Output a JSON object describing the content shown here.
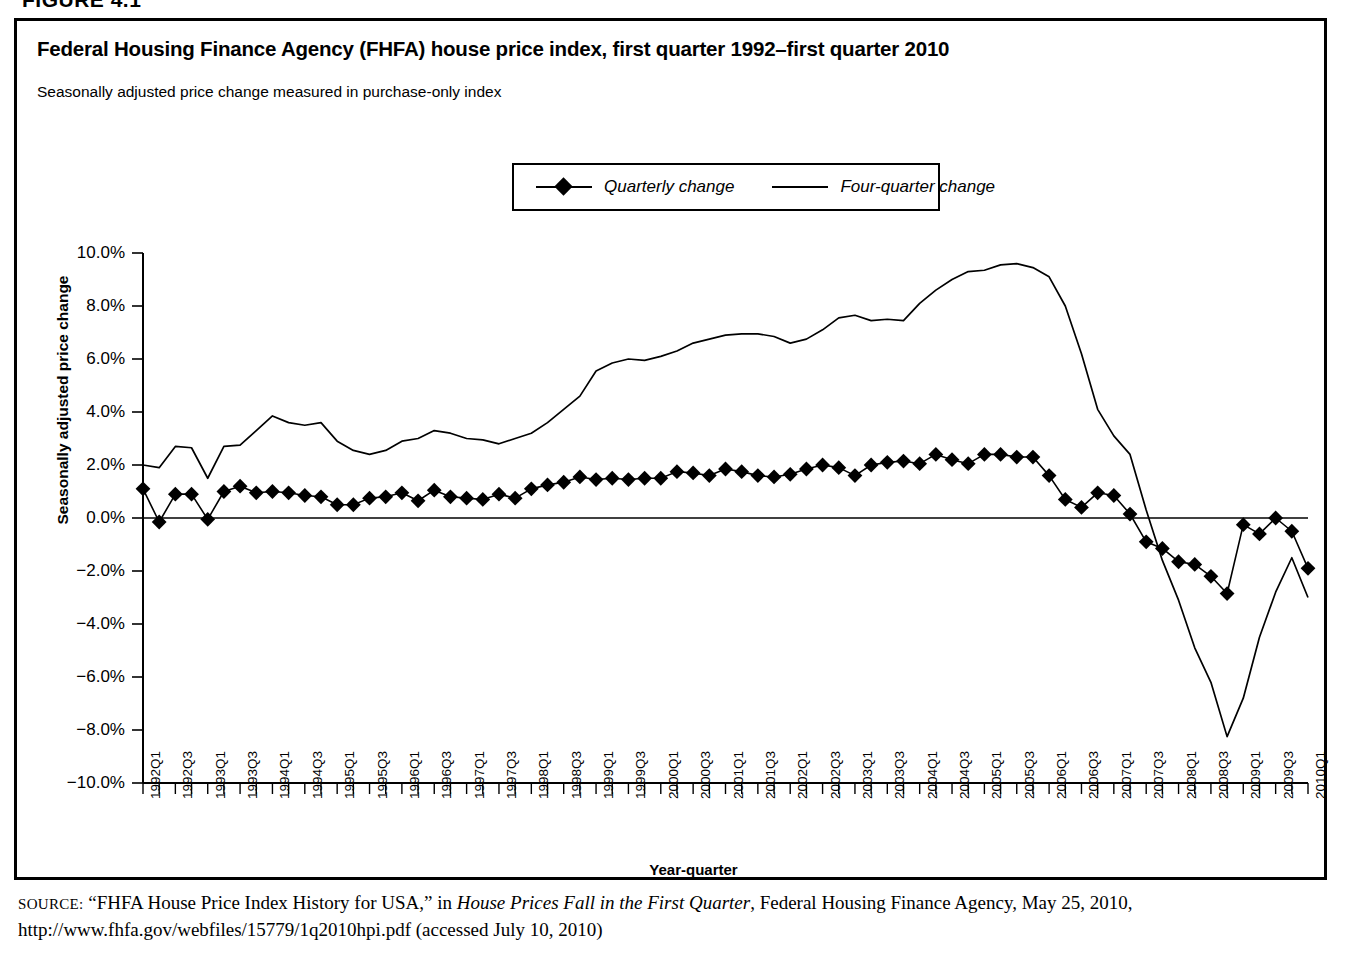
{
  "figure_header": "FIGURE 4.1",
  "chart": {
    "title": "Federal Housing Finance Agency (FHFA) house price index, first quarter 1992–first quarter 2010",
    "subtitle": "Seasonally adjusted price change measured in purchase-only index",
    "legend": [
      {
        "label": "Quarterly change",
        "marker": "diamond-marker-icon"
      },
      {
        "label": "Four-quarter change",
        "marker": "plain-line-icon"
      }
    ]
  },
  "source": {
    "prefix": "SOURCE:",
    "part1": " “FHFA House Price Index History for USA,” in ",
    "italic": "House Prices Fall in the First Quarter",
    "part2": ", Federal Housing Finance Agency, May 25, 2010, http://www.fhfa.gov/webfiles/15779/1q2010hpi.pdf (accessed July 10, 2010)"
  },
  "chart_data": {
    "type": "line",
    "title": "Federal Housing Finance Agency (FHFA) house price index, first quarter 1992–first quarter 2010",
    "subtitle": "Seasonally adjusted price change measured in purchase-only index",
    "xlabel": "Year-quarter",
    "ylabel": "Seasonally adjusted price change",
    "ylim": [
      -10.0,
      10.0
    ],
    "yticks": [
      10.0,
      8.0,
      6.0,
      4.0,
      2.0,
      0.0,
      -2.0,
      -4.0,
      -6.0,
      -8.0,
      -10.0
    ],
    "ytick_labels": [
      "10.0%",
      "8.0%",
      "6.0%",
      "4.0%",
      "2.0%",
      "0.0%",
      "−2.0%",
      "−4.0%",
      "−6.0%",
      "−8.0%",
      "−10.0%"
    ],
    "grid": false,
    "legend_position": "top-center",
    "x": [
      "1992Q1",
      "1992Q2",
      "1992Q3",
      "1992Q4",
      "1993Q1",
      "1993Q2",
      "1993Q3",
      "1993Q4",
      "1994Q1",
      "1994Q2",
      "1994Q3",
      "1994Q4",
      "1995Q1",
      "1995Q2",
      "1995Q3",
      "1995Q4",
      "1996Q1",
      "1996Q2",
      "1996Q3",
      "1996Q4",
      "1997Q1",
      "1997Q2",
      "1997Q3",
      "1997Q4",
      "1998Q1",
      "1998Q2",
      "1998Q3",
      "1998Q4",
      "1999Q1",
      "1999Q2",
      "1999Q3",
      "1999Q4",
      "2000Q1",
      "2000Q2",
      "2000Q3",
      "2000Q4",
      "2001Q1",
      "2001Q2",
      "2001Q3",
      "2001Q4",
      "2002Q1",
      "2002Q2",
      "2002Q3",
      "2002Q4",
      "2003Q1",
      "2003Q2",
      "2003Q3",
      "2003Q4",
      "2004Q1",
      "2004Q2",
      "2004Q3",
      "2004Q4",
      "2005Q1",
      "2005Q2",
      "2005Q3",
      "2005Q4",
      "2006Q1",
      "2006Q2",
      "2006Q3",
      "2006Q4",
      "2007Q1",
      "2007Q2",
      "2007Q3",
      "2007Q4",
      "2008Q1",
      "2008Q2",
      "2008Q3",
      "2008Q4",
      "2009Q1",
      "2009Q2",
      "2009Q3",
      "2009Q4",
      "2010Q1"
    ],
    "xtick_labels": [
      "1992Q1",
      "1992Q3",
      "1993Q1",
      "1993Q3",
      "1994Q1",
      "1994Q3",
      "1995Q1",
      "1995Q3",
      "1996Q1",
      "1996Q3",
      "1997Q1",
      "1997Q3",
      "1998Q1",
      "1998Q3",
      "1999Q1",
      "1999Q3",
      "2000Q1",
      "2000Q3",
      "2001Q1",
      "2001Q3",
      "2002Q1",
      "2002Q3",
      "2003Q1",
      "2003Q3",
      "2004Q1",
      "2004Q3",
      "2005Q1",
      "2005Q3",
      "2006Q1",
      "2006Q3",
      "2007Q1",
      "2007Q3",
      "2008Q1",
      "2008Q3",
      "2009Q1",
      "2009Q3",
      "2010Q1"
    ],
    "series": [
      {
        "name": "Quarterly change",
        "marker": "diamond",
        "values": [
          1.1,
          -0.15,
          0.9,
          0.9,
          -0.05,
          1.0,
          1.2,
          0.95,
          1.0,
          0.95,
          0.85,
          0.8,
          0.5,
          0.5,
          0.75,
          0.8,
          0.95,
          0.65,
          1.05,
          0.8,
          0.75,
          0.7,
          0.9,
          0.75,
          1.1,
          1.25,
          1.35,
          1.55,
          1.45,
          1.5,
          1.45,
          1.5,
          1.5,
          1.75,
          1.7,
          1.6,
          1.85,
          1.75,
          1.6,
          1.55,
          1.65,
          1.85,
          2.0,
          1.9,
          1.6,
          2.0,
          2.1,
          2.15,
          2.05,
          2.4,
          2.2,
          2.05,
          2.4,
          2.4,
          2.3,
          2.3,
          1.6,
          0.7,
          0.4,
          0.95,
          0.85,
          0.15,
          -0.9,
          -1.15,
          -1.65,
          -1.75,
          -2.2,
          -2.85,
          -0.25,
          -0.6,
          0.0,
          -0.5,
          -1.9
        ]
      },
      {
        "name": "Four-quarter change",
        "marker": "none",
        "values": [
          2.0,
          1.9,
          2.7,
          2.65,
          1.5,
          2.7,
          2.75,
          3.3,
          3.85,
          3.6,
          3.5,
          3.6,
          2.9,
          2.55,
          2.4,
          2.55,
          2.9,
          3.0,
          3.3,
          3.2,
          3.0,
          2.95,
          2.8,
          3.0,
          3.2,
          3.6,
          4.1,
          4.6,
          5.55,
          5.85,
          6.0,
          5.95,
          6.1,
          6.3,
          6.6,
          6.75,
          6.9,
          6.95,
          6.95,
          6.85,
          6.6,
          6.75,
          7.1,
          7.55,
          7.65,
          7.45,
          7.5,
          7.45,
          8.1,
          8.6,
          9.0,
          9.3,
          9.35,
          9.55,
          9.6,
          9.45,
          9.1,
          8.0,
          6.2,
          4.1,
          3.1,
          2.4,
          0.3,
          -1.6,
          -3.1,
          -4.9,
          -6.2,
          -8.25,
          -6.8,
          -4.5,
          -2.8,
          -1.5,
          -3.0
        ]
      }
    ]
  }
}
